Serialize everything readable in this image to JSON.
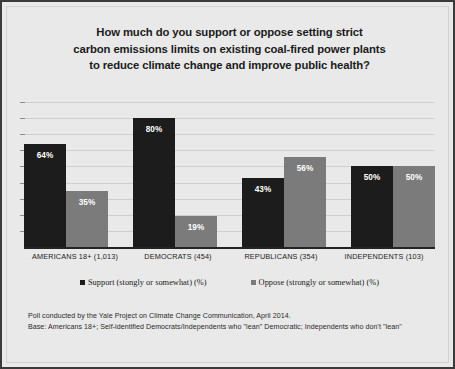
{
  "title": {
    "lines": [
      "How much do you support or oppose setting strict",
      "carbon emissions limits on existing coal-fired power plants",
      "to reduce climate change and improve public health?"
    ]
  },
  "legend": {
    "support_label": "Support (stongly or somewhat) (%)",
    "oppose_label": "Oppose (strongly or somewhat) (%)"
  },
  "footer": {
    "line1": "Poll conducted by the Yale Project on Climate Change Communication, April 2014.",
    "line2": "Base: Americans 18+; Self-identified Democrats/Independents who \"lean\" Democratic; Independents who don't \"lean\""
  },
  "colors": {
    "support": "#1c1c1c",
    "oppose": "#7b7b7b",
    "background": "#e9e9e9",
    "border": "#3a3a3a",
    "gridline": "#cfcfcf"
  },
  "chart_data": {
    "type": "bar",
    "title": "How much do you support or oppose setting strict carbon emissions limits on existing coal-fired power plants to reduce climate change and improve public health?",
    "xlabel": "",
    "ylabel": "",
    "ylim": [
      0,
      90
    ],
    "grid": true,
    "gridline_values": [
      10,
      20,
      30,
      40,
      50,
      60,
      70,
      80,
      90
    ],
    "legend_position": "bottom",
    "categories": [
      "AMERICANS 18+ (1,013)",
      "DEMOCRATS (454)",
      "REPUBLICANS (354)",
      "INDEPENDENTS (103)"
    ],
    "series": [
      {
        "name": "Support (stongly or somewhat) (%)",
        "color": "#1c1c1c",
        "values": [
          64,
          80,
          43,
          50
        ],
        "labels": [
          "64%",
          "80%",
          "43%",
          "50%"
        ]
      },
      {
        "name": "Oppose (strongly or somewhat) (%)",
        "color": "#7b7b7b",
        "values": [
          35,
          19,
          56,
          50
        ],
        "labels": [
          "35%",
          "19%",
          "56%",
          "50%"
        ]
      }
    ],
    "annotations": [
      "Poll conducted by the Yale Project on Climate Change Communication, April 2014.",
      "Base: Americans 18+; Self-identified Democrats/Independents who \"lean\" Democratic; Independents who don't \"lean\""
    ]
  }
}
